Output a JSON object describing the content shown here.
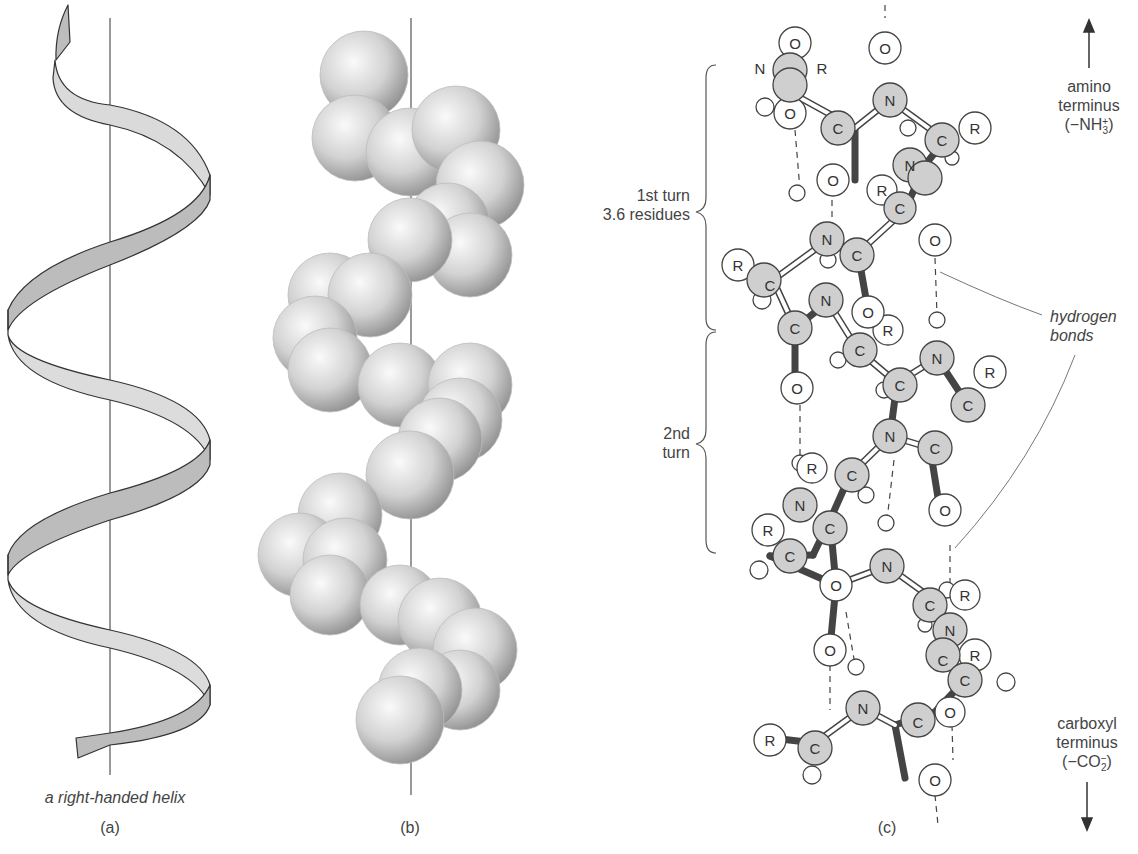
{
  "figure": {
    "panels": [
      {
        "id": "a",
        "label": "(a)",
        "caption": "a right-handed helix"
      },
      {
        "id": "b",
        "label": "(b)",
        "caption": ""
      },
      {
        "id": "c",
        "label": "(c)",
        "caption": ""
      }
    ],
    "annotations": {
      "first_turn_line1": "1st turn",
      "first_turn_line2": "3.6 residues",
      "second_turn_line1": "2nd",
      "second_turn_line2": "turn",
      "hydrogen_bonds_line1": "hydrogen",
      "hydrogen_bonds_line2": "bonds",
      "amino_line1": "amino",
      "amino_line2": "terminus",
      "amino_formula_main": "(−NH",
      "amino_formula_sub": "3",
      "amino_formula_sup": "+",
      "amino_formula_close": ")",
      "carboxyl_line1": "carboxyl",
      "carboxyl_line2": "terminus",
      "carboxyl_formula_main": "(−CO",
      "carboxyl_formula_sub": "2",
      "carboxyl_formula_sup": "−",
      "carboxyl_formula_close": ")"
    },
    "atom_labels": {
      "carbon": "C",
      "nitrogen": "N",
      "oxygen": "O",
      "side_chain": "R"
    },
    "colors": {
      "ribbon_fill": "#d6d6d6",
      "ribbon_dark": "#b8b8b8",
      "outline": "#444444",
      "backbone_atom": "#cfcfcf",
      "sphere_light": "#f2f2f2",
      "sphere_dark": "#9a9a9a"
    }
  }
}
